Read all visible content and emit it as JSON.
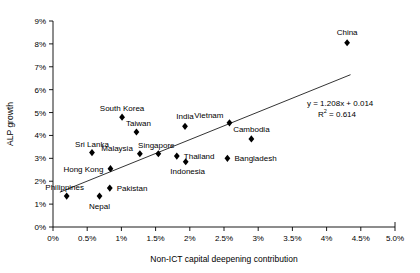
{
  "chart_data": {
    "type": "scatter",
    "title": "",
    "xlabel": "Non-ICT capital deepening contribution",
    "ylabel": "ALP growth",
    "xlim": [
      0,
      5.0
    ],
    "ylim": [
      0,
      9
    ],
    "grid": false,
    "legend": "none",
    "xtick_labels": [
      "0%",
      "0.5%",
      "1%",
      "1.5%",
      "2%",
      "2.5%",
      "3%",
      "3.5%",
      "4%",
      "4.5%",
      "5.0%"
    ],
    "xtick_values": [
      0,
      0.5,
      1.0,
      1.5,
      2.0,
      2.5,
      3.0,
      3.5,
      4.0,
      4.5,
      5.0
    ],
    "ytick_labels": [
      "0%",
      "1%",
      "2%",
      "3%",
      "4%",
      "5%",
      "6%",
      "7%",
      "8%",
      "9%"
    ],
    "ytick_values": [
      0,
      1,
      2,
      3,
      4,
      5,
      6,
      7,
      8,
      9
    ],
    "points": [
      {
        "label": "Philippines",
        "x": 0.2,
        "y": 1.35,
        "label_dx": -2,
        "label_dy": -6,
        "anchor": "middle"
      },
      {
        "label": "Nepal",
        "x": 0.68,
        "y": 1.35,
        "label_dx": 0,
        "label_dy": 13,
        "anchor": "middle"
      },
      {
        "label": "Pakistan",
        "x": 0.83,
        "y": 1.7,
        "label_dx": 7,
        "label_dy": 3,
        "anchor": "start"
      },
      {
        "label": "Hong Kong",
        "x": 0.84,
        "y": 2.55,
        "label_dx": -7,
        "label_dy": 3,
        "anchor": "end"
      },
      {
        "label": "Sri Lanka",
        "x": 0.57,
        "y": 3.25,
        "label_dx": 0,
        "label_dy": -6,
        "anchor": "middle"
      },
      {
        "label": "Malaysia",
        "x": 1.27,
        "y": 3.2,
        "label_dx": -7,
        "label_dy": -3,
        "anchor": "end"
      },
      {
        "label": "Singapore",
        "x": 1.54,
        "y": 3.2,
        "label_dx": -2,
        "label_dy": -6,
        "anchor": "middle"
      },
      {
        "label": "Thailand",
        "x": 1.81,
        "y": 3.1,
        "label_dx": 7,
        "label_dy": 3,
        "anchor": "start"
      },
      {
        "label": "Indonesia",
        "x": 1.94,
        "y": 2.85,
        "label_dx": 2,
        "label_dy": 12,
        "anchor": "middle"
      },
      {
        "label": "South Korea",
        "x": 1.01,
        "y": 4.8,
        "label_dx": 0,
        "label_dy": -6,
        "anchor": "middle"
      },
      {
        "label": "Taiwan",
        "x": 1.22,
        "y": 4.15,
        "label_dx": 2,
        "label_dy": -6,
        "anchor": "middle"
      },
      {
        "label": "India",
        "x": 1.93,
        "y": 4.4,
        "label_dx": 0,
        "label_dy": -7,
        "anchor": "middle"
      },
      {
        "label": "Vietnam",
        "x": 2.58,
        "y": 4.55,
        "label_dx": -6,
        "label_dy": -5,
        "anchor": "end"
      },
      {
        "label": "Cambodia",
        "x": 2.9,
        "y": 3.85,
        "label_dx": 0,
        "label_dy": -7,
        "anchor": "middle"
      },
      {
        "label": "Bangladesh",
        "x": 2.55,
        "y": 3.0,
        "label_dx": 7,
        "label_dy": 3,
        "anchor": "start"
      },
      {
        "label": "China",
        "x": 4.3,
        "y": 8.05,
        "label_dx": 0,
        "label_dy": -8,
        "anchor": "middle"
      }
    ],
    "trendline": {
      "slope": 1.208,
      "intercept": 0.014,
      "r_squared": 0.614,
      "x_start": 0.1,
      "x_end": 4.35,
      "equation_text": "y = 1.208x + 0.014",
      "r2_prefix": "R",
      "r2_exponent": "2",
      "r2_value": " = 0.614"
    }
  }
}
